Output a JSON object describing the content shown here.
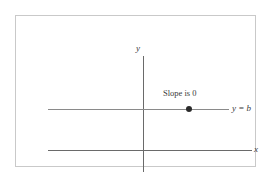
{
  "figure": {
    "title": "",
    "background_color": "#ffffff",
    "frame_color": "#c9c9c9",
    "axis_color": "#6a6a6a",
    "line_color": "#8a8a8a",
    "point_color": "#2a2a2a",
    "text_color": "#3a3a3a"
  },
  "labels": {
    "y_axis": "y",
    "x_axis": "x",
    "line_equation": "y = b",
    "annotation": "Slope is 0"
  },
  "chart_data": {
    "type": "line",
    "title": "",
    "xlabel": "x",
    "ylabel": "y",
    "grid": false,
    "legend": "none",
    "annotations": [
      {
        "text": "Slope is 0",
        "target": "horizontal-line"
      },
      {
        "text": "y = b",
        "target": "horizontal-line-right-end"
      }
    ],
    "series": [
      {
        "name": "y = b",
        "equation": "y = b",
        "slope": 0,
        "intercept": "b",
        "style": "solid-horizontal",
        "points": [
          {
            "x": -4.75,
            "y": 1
          },
          {
            "x": 4.3,
            "y": 1
          }
        ],
        "markers": [
          {
            "x": 2.2,
            "y": 1,
            "label": "Slope is 0"
          }
        ]
      }
    ],
    "axes": {
      "x_axis_drawn": true,
      "y_axis_drawn": true,
      "xlim": [
        -4.75,
        5.4
      ],
      "ylim": [
        -0.55,
        2.35
      ],
      "tick_labels_x": [],
      "tick_labels_y": []
    }
  }
}
